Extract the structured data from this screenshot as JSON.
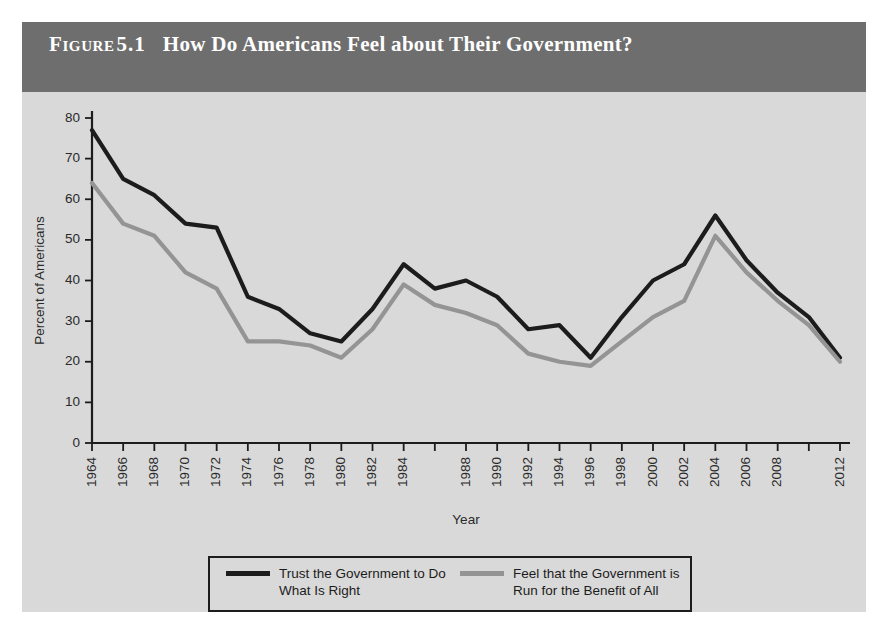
{
  "figure": {
    "label": "Figure",
    "number": "5.1",
    "title": "How Do Americans Feel about Their Government?",
    "title_bar_color": "#6e6e6e",
    "panel_color": "#d9d9d9",
    "page_color": "#ffffff"
  },
  "chart_data": {
    "type": "line",
    "title": "How Do Americans Feel about Their Government?",
    "xlabel": "Year",
    "ylabel": "Percent of Americans",
    "ylim": [
      0,
      80
    ],
    "ytick_values": [
      0,
      10,
      20,
      30,
      40,
      50,
      60,
      70,
      80
    ],
    "ytick_labels": [
      "0",
      "10",
      "20",
      "30",
      "40",
      "50",
      "60",
      "70",
      "80"
    ],
    "grid": false,
    "legend_position": "bottom",
    "x": [
      1964,
      1966,
      1968,
      1970,
      1972,
      1974,
      1976,
      1978,
      1980,
      1982,
      1984,
      1986,
      1988,
      1990,
      1992,
      1994,
      1996,
      1998,
      2000,
      2002,
      2004,
      2006,
      2008,
      2010,
      2012
    ],
    "xtick_labels": [
      "1964",
      "1966",
      "1968",
      "1970",
      "1972",
      "1974",
      "1976",
      "1978",
      "1980",
      "1982",
      "1984",
      "",
      "1988",
      "1990",
      "1992",
      "1994",
      "1996",
      "1998",
      "2000",
      "2002",
      "2004",
      "2006",
      "2008",
      "",
      "2012"
    ],
    "series": [
      {
        "name": "Trust the Government to Do What Is Right",
        "legend_label": "Trust the Government to Do\nWhat Is Right",
        "color": "#1c1c1c",
        "values": [
          77,
          65,
          61,
          54,
          53,
          36,
          33,
          27,
          25,
          33,
          44,
          38,
          40,
          36,
          28,
          29,
          21,
          31,
          40,
          44,
          56,
          45,
          37,
          31,
          21
        ]
      },
      {
        "name": "Feel that the Government is Run for the Benefit of All",
        "legend_label": "Feel that the Government is\nRun for the Benefit of All",
        "color": "#949494",
        "values": [
          64,
          54,
          51,
          42,
          38,
          25,
          25,
          24,
          21,
          28,
          39,
          34,
          32,
          29,
          22,
          20,
          19,
          25,
          31,
          35,
          51,
          42,
          35,
          29,
          20
        ]
      }
    ]
  }
}
